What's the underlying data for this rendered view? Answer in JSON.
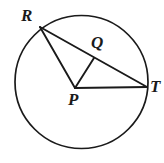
{
  "figure": {
    "type": "circle-geometry-diagram",
    "canvas": {
      "width": 164,
      "height": 163,
      "background": "#ffffff"
    },
    "stroke_color": "#1a1a1a",
    "label_color": "#1a1a1a",
    "circle": {
      "name": "circle-P",
      "center_x": 81.5,
      "center_y": 82,
      "radius": 66.5,
      "stroke_width": 1.7,
      "fill": "none"
    },
    "points": [
      {
        "id": "R",
        "label": "R",
        "x": 40,
        "y": 27,
        "on": "circle"
      },
      {
        "id": "Q",
        "label": "Q",
        "x": 94,
        "y": 58,
        "on": "chord-RT"
      },
      {
        "id": "P",
        "label": "P",
        "x": 75,
        "y": 88,
        "on": "center"
      },
      {
        "id": "T",
        "label": "T",
        "x": 147,
        "y": 87,
        "on": "circle"
      }
    ],
    "segments": [
      {
        "id": "RT",
        "from": "R",
        "to": "T",
        "x1": 40,
        "y1": 27,
        "x2": 147,
        "y2": 87,
        "stroke_width": 1.9
      },
      {
        "id": "RP",
        "from": "R",
        "to": "P",
        "x1": 40,
        "y1": 27,
        "x2": 75,
        "y2": 88,
        "stroke_width": 1.9
      },
      {
        "id": "PQ",
        "from": "P",
        "to": "Q",
        "x1": 75,
        "y1": 88,
        "x2": 94,
        "y2": 58,
        "stroke_width": 1.9
      },
      {
        "id": "PT",
        "from": "P",
        "to": "T",
        "x1": 75,
        "y1": 88,
        "x2": 147,
        "y2": 87,
        "stroke_width": 1.9
      }
    ],
    "labels": {
      "R": "R",
      "Q": "Q",
      "P": "P",
      "T": "T"
    }
  }
}
